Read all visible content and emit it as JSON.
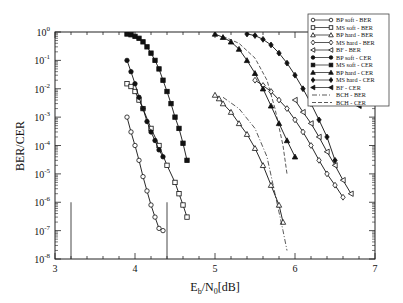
{
  "chart_data": {
    "type": "line",
    "title": "",
    "xlabel": "Eb/N0[dB]",
    "ylabel": "BER/CER",
    "xlim": [
      3,
      7
    ],
    "ylim": [
      1e-08,
      1
    ],
    "yscale": "log",
    "xticks": [
      "3",
      "4",
      "5",
      "6",
      "7"
    ],
    "yticks": [
      "10^0",
      "10^-1",
      "10^-2",
      "10^-3",
      "10^-4",
      "10^-5",
      "10^-6",
      "10^-7",
      "10^-8"
    ],
    "grid": false,
    "legend_position": "upper right",
    "series": [
      {
        "name": "BP soft - BER",
        "marker": "circle-open",
        "style": "solid",
        "x": [
          3.9,
          3.95,
          4.0,
          4.05,
          4.1,
          4.15,
          4.2,
          4.25,
          4.3,
          4.35
        ],
        "y": [
          0.001,
          0.0003,
          0.0001,
          3e-05,
          8e-06,
          2.5e-06,
          8e-07,
          3e-07,
          1.2e-07,
          1e-07
        ]
      },
      {
        "name": "MS soft - BER",
        "marker": "square-open",
        "style": "solid",
        "x": [
          3.9,
          3.95,
          4.0,
          4.05,
          4.1,
          4.2,
          4.3,
          4.4,
          4.5,
          4.55,
          4.6,
          4.65
        ],
        "y": [
          0.015,
          0.012,
          0.008,
          0.004,
          0.002,
          0.0004,
          0.0001,
          2e-05,
          5e-06,
          2e-06,
          8e-07,
          3e-07
        ]
      },
      {
        "name": "BP hard - BER",
        "marker": "triangle-open",
        "style": "solid",
        "x": [
          5.0,
          5.05,
          5.1,
          5.2,
          5.3,
          5.4,
          5.5,
          5.6,
          5.7,
          5.8,
          5.85
        ],
        "y": [
          0.006,
          0.0045,
          0.003,
          0.0015,
          0.0006,
          0.00025,
          8e-05,
          2e-05,
          4e-06,
          8e-07,
          2e-07
        ]
      },
      {
        "name": "MS hard - BER",
        "marker": "diamond-open",
        "style": "solid",
        "x": [
          5.5,
          5.6,
          5.7,
          5.8,
          5.9,
          6.0,
          6.1,
          6.2,
          6.3,
          6.4,
          6.5,
          6.6
        ],
        "y": [
          0.02,
          0.013,
          0.008,
          0.004,
          0.002,
          0.0008,
          0.0003,
          0.0001,
          3e-05,
          1e-05,
          4e-06,
          1.5e-06
        ]
      },
      {
        "name": "BF - BER",
        "marker": "left-triangle-open",
        "style": "solid",
        "x": [
          6.0,
          6.1,
          6.2,
          6.3,
          6.4,
          6.5,
          6.6,
          6.7
        ],
        "y": [
          0.004,
          0.0015,
          0.0006,
          0.0002,
          6e-05,
          2e-05,
          6e-06,
          2e-06
        ]
      },
      {
        "name": "BP soft - CER",
        "marker": "circle-filled",
        "style": "solid",
        "x": [
          3.9,
          3.95,
          4.0,
          4.05,
          4.1,
          4.15,
          4.2,
          4.25,
          4.3,
          4.35
        ],
        "y": [
          0.1,
          0.04,
          0.015,
          0.005,
          0.002,
          0.0007,
          0.0003,
          0.00015,
          7e-05,
          4e-05
        ]
      },
      {
        "name": "MS soft - CER",
        "marker": "square-filled",
        "style": "solid",
        "x": [
          3.9,
          3.95,
          4.0,
          4.05,
          4.1,
          4.15,
          4.2,
          4.25,
          4.3,
          4.35,
          4.4,
          4.45,
          4.5,
          4.55,
          4.6,
          4.65
        ],
        "y": [
          0.85,
          0.8,
          0.7,
          0.6,
          0.45,
          0.3,
          0.18,
          0.1,
          0.05,
          0.02,
          0.008,
          0.003,
          0.001,
          0.0004,
          0.00012,
          3e-05
        ]
      },
      {
        "name": "BP hard - CER",
        "marker": "triangle-filled",
        "style": "solid",
        "x": [
          5.0,
          5.1,
          5.2,
          5.3,
          5.4,
          5.5,
          5.6,
          5.7,
          5.8,
          5.9,
          6.0
        ],
        "y": [
          0.85,
          0.65,
          0.45,
          0.25,
          0.1,
          0.035,
          0.01,
          0.0025,
          0.0006,
          0.00015,
          4e-05
        ]
      },
      {
        "name": "MS hard - CER",
        "marker": "diamond-filled",
        "style": "solid",
        "x": [
          5.4,
          5.5,
          5.6,
          5.7,
          5.8,
          5.9,
          6.0,
          6.1,
          6.2,
          6.3,
          6.4,
          6.5
        ],
        "y": [
          0.85,
          0.75,
          0.55,
          0.35,
          0.18,
          0.08,
          0.03,
          0.01,
          0.003,
          0.0008,
          0.0002,
          3e-05
        ]
      },
      {
        "name": "BF - CER",
        "marker": "left-triangle-filled",
        "style": "solid",
        "x": [
          6.25,
          6.35,
          6.45,
          6.55,
          6.65,
          6.75,
          6.8
        ],
        "y": [
          0.4,
          0.2,
          0.1,
          0.04,
          0.015,
          0.005,
          0.0025
        ]
      },
      {
        "name": "BCH - BER",
        "marker": "none",
        "style": "dashdot",
        "x": [
          5.1,
          5.3,
          5.5,
          5.65,
          5.75,
          5.85,
          5.9
        ],
        "y": [
          0.005,
          0.002,
          0.0004,
          4e-05,
          2e-06,
          1e-07,
          2e-08
        ]
      },
      {
        "name": "BCH - CER",
        "marker": "none",
        "style": "dashed",
        "x": [
          5.1,
          5.3,
          5.5,
          5.65,
          5.75,
          5.85,
          5.9
        ],
        "y": [
          0.7,
          0.4,
          0.12,
          0.02,
          0.002,
          0.0001,
          1e-05
        ]
      }
    ],
    "annotations": [
      {
        "type": "vline",
        "x": 3.2,
        "ymin": 1e-08,
        "ymax": 1e-06
      },
      {
        "type": "vline",
        "x": 4.4,
        "ymin": 1e-08,
        "ymax": 1e-06
      }
    ]
  },
  "axes": {
    "xlabel_main": "E",
    "xlabel_sub1": "b",
    "xlabel_mid": "/N",
    "xlabel_sub2": "0",
    "xlabel_tail": "[dB]",
    "ylabel": "BER/CER",
    "xtick_labels": [
      "3",
      "4",
      "5",
      "6",
      "7"
    ],
    "ytick_exponents": [
      "0",
      "-1",
      "-2",
      "-3",
      "-4",
      "-5",
      "-6",
      "-7",
      "-8"
    ],
    "ytick_base": "10"
  }
}
